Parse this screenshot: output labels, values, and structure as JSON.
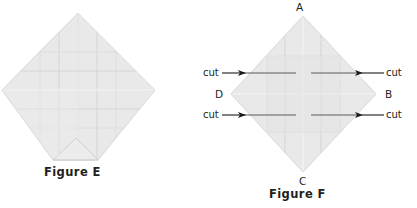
{
  "page": {
    "background": "#ffffff",
    "width": 417,
    "height": 208
  },
  "colors": {
    "paper_fill": "#e8e8e8",
    "paper_fill_light": "#ededed",
    "fold_line": "#cfcfcf",
    "crease_line": "#d8d8d8",
    "cut_line": "#555555",
    "arrow": "#1a1a1a",
    "text": "#231f20"
  },
  "figure_e": {
    "caption": "Figure E",
    "shape": "diamond-with-truncated-bottom",
    "geometry": {
      "top": [
        78,
        13
      ],
      "left": [
        2,
        90
      ],
      "right": [
        155,
        90
      ],
      "bottom_left": [
        53,
        160
      ],
      "bottom_right": [
        98,
        160
      ],
      "fold_apex": [
        76,
        138
      ]
    },
    "grid_rows": 4,
    "grid_cols": 4
  },
  "figure_f": {
    "caption": "Figure F",
    "shape": "diamond",
    "geometry": {
      "top": [
        303,
        16
      ],
      "right": [
        376,
        94
      ],
      "bottom": [
        303,
        172
      ],
      "left": [
        231,
        94
      ]
    },
    "vertices": [
      {
        "name": "A",
        "label": "A",
        "position": "top"
      },
      {
        "name": "B",
        "label": "B",
        "position": "right"
      },
      {
        "name": "C",
        "label": "C",
        "position": "bottom"
      },
      {
        "name": "D",
        "label": "D",
        "position": "left"
      }
    ],
    "cut_labels": [
      {
        "name": "cut-top-left",
        "label": "cut",
        "arrow": "→",
        "direction": "right",
        "y": 73
      },
      {
        "name": "cut-bottom-left",
        "label": "cut",
        "arrow": "→",
        "direction": "right",
        "y": 115
      },
      {
        "name": "cut-top-right",
        "label": "cut",
        "arrow": "←",
        "direction": "left",
        "y": 73
      },
      {
        "name": "cut-bottom-right",
        "label": "cut",
        "arrow": "←",
        "direction": "left",
        "y": 115
      }
    ],
    "grid_rows": 4,
    "grid_cols": 4
  }
}
